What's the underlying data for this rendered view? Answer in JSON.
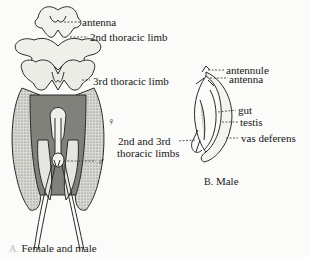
{
  "figure": {
    "panel_a": {
      "caption_prefix": "A.",
      "caption": "Female and male",
      "labels": {
        "antenna": "antenna",
        "second_limb": "2nd thoracic limb",
        "third_limb": "3rd thoracic limb",
        "female_symbol": "♀",
        "male_symbol": "♂"
      }
    },
    "panel_b": {
      "caption_prefix": "B.",
      "caption": "Male",
      "labels": {
        "antennule": "antennule",
        "antenna": "antenna",
        "gut": "gut",
        "testis": "testis",
        "vas_deferens": "vas deferens",
        "limbs_line1": "2nd and 3rd",
        "limbs_line2": "thoracic limbs"
      }
    }
  }
}
